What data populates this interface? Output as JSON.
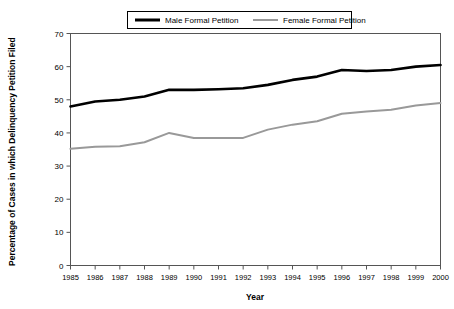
{
  "chart_data": {
    "type": "line",
    "title": "",
    "xlabel": "Year",
    "ylabel": "Percentage of Cases in which Delinquency Petition Filed",
    "categories": [
      1985,
      1986,
      1987,
      1988,
      1989,
      1990,
      1991,
      1992,
      1993,
      1994,
      1995,
      1996,
      1997,
      1998,
      1999,
      2000
    ],
    "x": [
      "1985",
      "1986",
      "1987",
      "1988",
      "1989",
      "1990",
      "1991",
      "1992",
      "1993",
      "1994",
      "1995",
      "1996",
      "1997",
      "1998",
      "1999",
      "2000"
    ],
    "xlim": [
      1985,
      2000
    ],
    "ylim": [
      0,
      70
    ],
    "yticks": [
      0,
      10,
      20,
      30,
      40,
      50,
      60,
      70
    ],
    "ytick_labels": [
      "0",
      "10",
      "20",
      "30",
      "40",
      "50",
      "60",
      "70"
    ],
    "grid": false,
    "legend_position": "top-center",
    "series": [
      {
        "name": "Male Formal Petition",
        "color": "#000000",
        "width": 2.6,
        "values": [
          48.0,
          49.5,
          50.0,
          51.0,
          53.0,
          53.0,
          53.2,
          53.5,
          54.5,
          56.0,
          57.0,
          59.0,
          58.7,
          59.0,
          60.0,
          60.5
        ]
      },
      {
        "name": "Female Formal Petition",
        "color": "#999999",
        "width": 2.0,
        "values": [
          35.2,
          35.8,
          36.0,
          37.2,
          40.0,
          38.5,
          38.5,
          38.5,
          41.0,
          42.5,
          43.5,
          45.8,
          46.5,
          47.0,
          48.3,
          49.0
        ]
      }
    ]
  },
  "legend": {
    "items": [
      {
        "label": "Male Formal Petition"
      },
      {
        "label": "Female Formal Petition"
      }
    ]
  },
  "axes": {
    "y_title": "Percentage of Cases in which Delinquency Petition Filed",
    "x_title": "Year"
  }
}
